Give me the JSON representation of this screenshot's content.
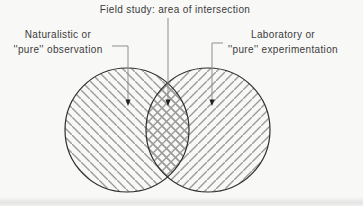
{
  "diagram_type": "venn",
  "figure": {
    "intersection": {
      "label": "Field study: area of intersection"
    },
    "left_set": {
      "label_line1": "Naturalistic or",
      "label_line2": "''pure'' observation",
      "hatch_direction": "backslash"
    },
    "right_set": {
      "label_line1": "Laboratory or",
      "label_line2": "''pure'' experimentation",
      "hatch_direction": "slash"
    }
  },
  "colors": {
    "background": "#f8f8f7",
    "outline": "#2e2e2e",
    "hatch": "#9c9c9c",
    "leader": "#8f8f8f",
    "arrow": "#222222",
    "text": "#3b3b3b"
  }
}
